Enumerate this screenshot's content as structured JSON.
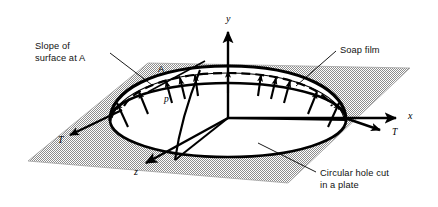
{
  "figure": {
    "name": "soap-film-membrane-analogy",
    "background_color": "#ffffff",
    "plate_fill_color": "#b5b5b5",
    "line_color": "#000000",
    "width": 438,
    "height": 207
  },
  "callouts": [
    {
      "id": "slope-at-a",
      "lines": [
        "Slope of",
        "surface at A"
      ],
      "text_x": 35,
      "text_y": 49,
      "leader": {
        "x1": 110,
        "y1": 53,
        "x2": 152,
        "y2": 85
      }
    },
    {
      "id": "soap-film",
      "lines": [
        "Soap film"
      ],
      "text_x": 340,
      "text_y": 53,
      "leader": {
        "x1": 336,
        "y1": 51,
        "x2": 296,
        "y2": 86
      }
    },
    {
      "id": "circular-hole",
      "lines": [
        "Circular hole cut",
        "in a plate"
      ],
      "text_x": 320,
      "text_y": 176,
      "leader": {
        "x1": 316,
        "y1": 172,
        "x2": 258,
        "y2": 143
      }
    }
  ],
  "axes": [
    {
      "id": "y-axis",
      "label": "y",
      "label_x": 226,
      "label_y": 22,
      "x1": 228,
      "y1": 118,
      "x2": 228,
      "y2": 30
    },
    {
      "id": "x-axis",
      "label": "x",
      "label_x": 408,
      "label_y": 119,
      "x1": 228,
      "y1": 118,
      "x2": 398,
      "y2": 118
    },
    {
      "id": "z-axis",
      "label": "z",
      "label_x": 134,
      "label_y": 175,
      "x1": 228,
      "y1": 118,
      "x2": 143,
      "y2": 164
    }
  ],
  "tension_arrows": [
    {
      "id": "tension-left",
      "label": "T",
      "label_x": 58,
      "label_y": 143,
      "x1": 122,
      "y1": 110,
      "x2": 68,
      "y2": 136
    },
    {
      "id": "tension-right",
      "label": "T",
      "label_x": 392,
      "label_y": 135,
      "x1": 345,
      "y1": 118,
      "x2": 381,
      "y2": 131
    }
  ],
  "markers": [
    {
      "id": "point-a",
      "label": "A",
      "x": 158,
      "y": 72
    },
    {
      "id": "pressure-p",
      "label": "p",
      "x": 164,
      "y": 102
    }
  ],
  "pressure_arrow_count": 11,
  "geometry": {
    "plate_corners": "28,161 148,63 410,68 288,183",
    "hole_center_x": 228,
    "hole_center_y": 120,
    "hole_rx": 118,
    "hole_ry": 37,
    "film_apex_y": 66
  }
}
